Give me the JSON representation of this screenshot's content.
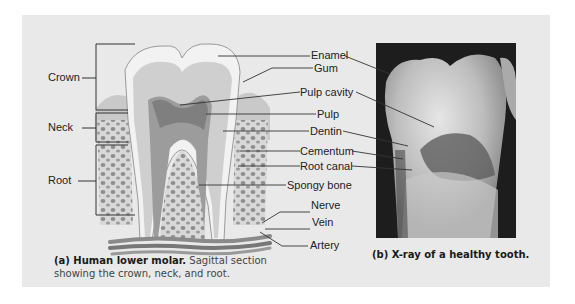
{
  "figure": {
    "panel_background": "#e9e9e9",
    "diagram": {
      "region_labels": [
        {
          "label": "Crown"
        },
        {
          "label": "Neck"
        },
        {
          "label": "Root"
        }
      ],
      "structure_labels": [
        {
          "label": "Enamel"
        },
        {
          "label": "Gum"
        },
        {
          "label": "Pulp cavity"
        },
        {
          "label": "Pulp"
        },
        {
          "label": "Dentin"
        },
        {
          "label": "Cementum"
        },
        {
          "label": "Root canal"
        },
        {
          "label": "Spongy bone"
        },
        {
          "label": "Nerve"
        },
        {
          "label": "Vein"
        },
        {
          "label": "Artery"
        }
      ]
    },
    "caption_a": {
      "bold": "(a) Human lower molar.",
      "line1_rest": " Sagittal section",
      "line2": "showing the crown, neck, and root."
    },
    "caption_b": {
      "bold": "(b) X-ray of a healthy tooth."
    }
  }
}
